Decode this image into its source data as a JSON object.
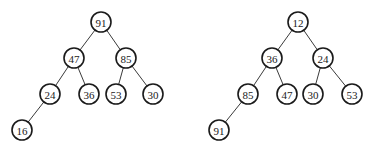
{
  "diagram": {
    "type": "binary-heaps",
    "trees": [
      {
        "name": "max-heap",
        "nodes": [
          {
            "id": "a0",
            "label": "91",
            "x": 101,
            "y": 22
          },
          {
            "id": "a1",
            "label": "47",
            "x": 74,
            "y": 58
          },
          {
            "id": "a2",
            "label": "85",
            "x": 126,
            "y": 58
          },
          {
            "id": "a3",
            "label": "24",
            "x": 50,
            "y": 94
          },
          {
            "id": "a4",
            "label": "36",
            "x": 89,
            "y": 94
          },
          {
            "id": "a5",
            "label": "53",
            "x": 116,
            "y": 94
          },
          {
            "id": "a6",
            "label": "30",
            "x": 153,
            "y": 94
          },
          {
            "id": "a7",
            "label": "16",
            "x": 22,
            "y": 130
          }
        ],
        "edges": [
          [
            "a0",
            "a1"
          ],
          [
            "a0",
            "a2"
          ],
          [
            "a1",
            "a3"
          ],
          [
            "a1",
            "a4"
          ],
          [
            "a2",
            "a5"
          ],
          [
            "a2",
            "a6"
          ],
          [
            "a3",
            "a7"
          ]
        ]
      },
      {
        "name": "min-heap",
        "nodes": [
          {
            "id": "b0",
            "label": "12",
            "x": 298,
            "y": 22
          },
          {
            "id": "b1",
            "label": "36",
            "x": 272,
            "y": 58
          },
          {
            "id": "b2",
            "label": "24",
            "x": 323,
            "y": 58
          },
          {
            "id": "b3",
            "label": "85",
            "x": 248,
            "y": 94
          },
          {
            "id": "b4",
            "label": "47",
            "x": 287,
            "y": 94
          },
          {
            "id": "b5",
            "label": "30",
            "x": 313,
            "y": 94
          },
          {
            "id": "b6",
            "label": "53",
            "x": 352,
            "y": 94
          },
          {
            "id": "b7",
            "label": "91",
            "x": 219,
            "y": 130
          }
        ],
        "edges": [
          [
            "b0",
            "b1"
          ],
          [
            "b0",
            "b2"
          ],
          [
            "b1",
            "b3"
          ],
          [
            "b1",
            "b4"
          ],
          [
            "b2",
            "b5"
          ],
          [
            "b2",
            "b6"
          ],
          [
            "b3",
            "b7"
          ]
        ]
      }
    ],
    "node_radius": 10,
    "colors": {
      "stroke": "#1a1a1a",
      "edge": "#3a3a3a",
      "fill": "#ffffff"
    }
  }
}
